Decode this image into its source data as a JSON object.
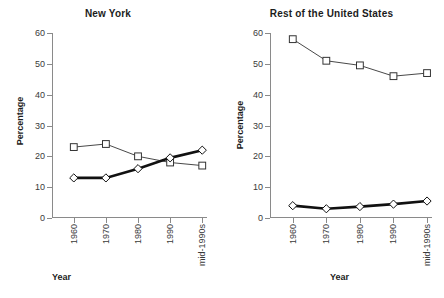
{
  "figure": {
    "axis_label_y": "Percentage",
    "axis_label_x": "Year"
  },
  "panels": [
    {
      "title": "New York"
    },
    {
      "title": "Rest of the United States"
    }
  ],
  "chart_data": [
    {
      "type": "line",
      "title": "New York",
      "xlabel": "Year",
      "ylabel": "Percentage",
      "categories": [
        "1960",
        "1970",
        "1980",
        "1990",
        "mid-1990s"
      ],
      "ylim": [
        0,
        60
      ],
      "yticks": [
        0,
        10,
        20,
        30,
        40,
        50,
        60
      ],
      "grid": false,
      "legend": "none",
      "series": [
        {
          "name": "open-square-series",
          "marker": "open-square",
          "line_weight": "thin",
          "color": "#333333",
          "values": [
            23,
            24,
            20,
            18,
            17
          ]
        },
        {
          "name": "open-diamond-series",
          "marker": "open-diamond",
          "line_weight": "thick",
          "color": "#111111",
          "values": [
            13,
            13,
            16,
            19.5,
            22
          ]
        }
      ]
    },
    {
      "type": "line",
      "title": "Rest of the United States",
      "xlabel": "Year",
      "ylabel": "Percentage",
      "categories": [
        "1960",
        "1970",
        "1980",
        "1990",
        "mid-1990s"
      ],
      "ylim": [
        0,
        60
      ],
      "yticks": [
        0,
        10,
        20,
        30,
        40,
        50,
        60
      ],
      "grid": false,
      "legend": "none",
      "series": [
        {
          "name": "open-square-series",
          "marker": "open-square",
          "line_weight": "thin",
          "color": "#333333",
          "values": [
            58,
            51,
            49.5,
            46,
            47
          ]
        },
        {
          "name": "open-diamond-series",
          "marker": "open-diamond",
          "line_weight": "thick",
          "color": "#111111",
          "values": [
            4,
            3,
            3.7,
            4.5,
            5.5
          ]
        }
      ]
    }
  ]
}
